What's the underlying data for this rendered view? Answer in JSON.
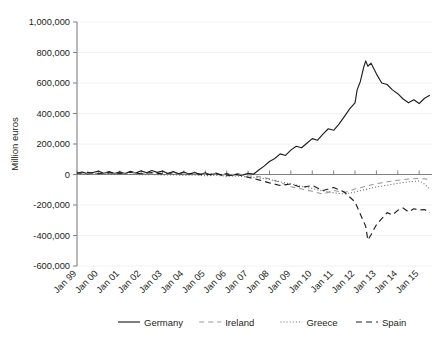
{
  "chart_data": {
    "type": "line",
    "title": "",
    "xlabel": "",
    "ylabel": "Million euros",
    "ylim": [
      -600000,
      1000000
    ],
    "ytick_labels": [
      "1,000,000",
      "800,000",
      "600,000",
      "400,000",
      "200,000",
      "0",
      "-200,000",
      "-400,000",
      "-600,000"
    ],
    "ytick_values": [
      1000000,
      800000,
      600000,
      400000,
      200000,
      0,
      -200000,
      -400000,
      -600000
    ],
    "xtick_labels": [
      "Jan 99",
      "Jan 00",
      "Jan 01",
      "Jan 02",
      "Jan 03",
      "Jan 04",
      "Jan 05",
      "Jan 06",
      "Jan 07",
      "Jan 08",
      "Jan 09",
      "Jan 10",
      "Jan 11",
      "Jan 12",
      "Jan 13",
      "Jan 14",
      "Jan 15"
    ],
    "xlim": [
      1999.0,
      2015.6
    ],
    "grid": "horizontal",
    "legend_position": "bottom",
    "series": [
      {
        "name": "Germany",
        "style": "solid",
        "color": "#231f20",
        "x": [
          1999.0,
          1999.25,
          1999.5,
          1999.75,
          2000.0,
          2000.25,
          2000.5,
          2000.75,
          2001.0,
          2001.25,
          2001.5,
          2001.75,
          2002.0,
          2002.25,
          2002.5,
          2002.75,
          2003.0,
          2003.25,
          2003.5,
          2003.75,
          2004.0,
          2004.25,
          2004.5,
          2004.75,
          2005.0,
          2005.25,
          2005.5,
          2005.75,
          2006.0,
          2006.25,
          2006.5,
          2006.75,
          2007.0,
          2007.25,
          2007.5,
          2007.75,
          2008.0,
          2008.25,
          2008.5,
          2008.75,
          2009.0,
          2009.25,
          2009.5,
          2009.75,
          2010.0,
          2010.25,
          2010.5,
          2010.75,
          2011.0,
          2011.25,
          2011.5,
          2011.75,
          2012.0,
          2012.1,
          2012.25,
          2012.4,
          2012.5,
          2012.6,
          2012.75,
          2013.0,
          2013.25,
          2013.5,
          2013.75,
          2014.0,
          2014.25,
          2014.5,
          2014.75,
          2015.0,
          2015.25,
          2015.5
        ],
        "y": [
          9000,
          16000,
          4000,
          13000,
          22000,
          8000,
          19000,
          6000,
          17000,
          5000,
          21000,
          9000,
          24000,
          11000,
          26000,
          14000,
          22000,
          7000,
          19000,
          4000,
          17000,
          2000,
          14000,
          -2000,
          12000,
          -3000,
          9000,
          -5000,
          6000,
          -6000,
          4000,
          -4000,
          8000,
          2000,
          30000,
          55000,
          85000,
          105000,
          135000,
          125000,
          160000,
          185000,
          175000,
          205000,
          235000,
          225000,
          265000,
          300000,
          290000,
          330000,
          380000,
          430000,
          470000,
          555000,
          610000,
          700000,
          745000,
          710000,
          730000,
          660000,
          600000,
          590000,
          555000,
          530000,
          495000,
          470000,
          490000,
          465000,
          500000,
          520000
        ]
      },
      {
        "name": "Ireland",
        "style": "dashed-light",
        "color": "#9a9a9a",
        "x": [
          1999.0,
          1999.5,
          2000.0,
          2000.5,
          2001.0,
          2001.5,
          2002.0,
          2002.5,
          2003.0,
          2003.5,
          2004.0,
          2004.5,
          2005.0,
          2005.5,
          2006.0,
          2006.5,
          2007.0,
          2007.5,
          2008.0,
          2008.5,
          2009.0,
          2009.5,
          2010.0,
          2010.5,
          2011.0,
          2011.5,
          2012.0,
          2012.5,
          2013.0,
          2013.5,
          2014.0,
          2014.5,
          2015.0,
          2015.5
        ],
        "y": [
          6000,
          10000,
          4000,
          12000,
          6000,
          14000,
          4000,
          11000,
          3000,
          9000,
          2000,
          8000,
          0,
          5000,
          -3000,
          2000,
          -8000,
          -14000,
          -28000,
          -52000,
          -80000,
          -95000,
          -110000,
          -128000,
          -105000,
          -118000,
          -95000,
          -78000,
          -60000,
          -48000,
          -38000,
          -30000,
          -26000,
          -32000
        ]
      },
      {
        "name": "Greece",
        "style": "dotted",
        "color": "#6b6b6b",
        "x": [
          1999.0,
          1999.5,
          2000.0,
          2000.5,
          2001.0,
          2001.5,
          2002.0,
          2002.5,
          2003.0,
          2003.5,
          2004.0,
          2004.5,
          2005.0,
          2005.5,
          2006.0,
          2006.5,
          2007.0,
          2007.5,
          2008.0,
          2008.5,
          2009.0,
          2009.5,
          2010.0,
          2010.5,
          2011.0,
          2011.5,
          2012.0,
          2012.5,
          2013.0,
          2013.5,
          2014.0,
          2014.5,
          2015.0,
          2015.25,
          2015.5
        ],
        "y": [
          2000,
          4000,
          1000,
          3000,
          0,
          2000,
          -2000,
          0,
          -4000,
          -2000,
          -6000,
          -4000,
          -8000,
          -6000,
          -12000,
          -10000,
          -16000,
          -22000,
          -32000,
          -48000,
          -62000,
          -78000,
          -92000,
          -108000,
          -120000,
          -128000,
          -115000,
          -98000,
          -82000,
          -70000,
          -58000,
          -48000,
          -42000,
          -62000,
          -96000
        ]
      },
      {
        "name": "Spain",
        "style": "dashed",
        "color": "#231f20",
        "x": [
          1999.0,
          1999.5,
          2000.0,
          2000.5,
          2001.0,
          2001.5,
          2002.0,
          2002.5,
          2003.0,
          2003.5,
          2004.0,
          2004.5,
          2005.0,
          2005.5,
          2006.0,
          2006.5,
          2007.0,
          2007.5,
          2008.0,
          2008.5,
          2009.0,
          2009.5,
          2010.0,
          2010.5,
          2011.0,
          2011.5,
          2012.0,
          2012.25,
          2012.5,
          2012.6,
          2012.75,
          2013.0,
          2013.25,
          2013.5,
          2013.75,
          2014.0,
          2014.25,
          2014.5,
          2014.75,
          2015.0,
          2015.25,
          2015.5
        ],
        "y": [
          8000,
          14000,
          5000,
          12000,
          7000,
          15000,
          5000,
          13000,
          4000,
          11000,
          2000,
          9000,
          -2000,
          5000,
          -8000,
          -2000,
          -18000,
          -35000,
          -55000,
          -72000,
          -62000,
          -85000,
          -72000,
          -105000,
          -85000,
          -115000,
          -180000,
          -260000,
          -340000,
          -430000,
          -395000,
          -330000,
          -290000,
          -250000,
          -265000,
          -235000,
          -220000,
          -245000,
          -225000,
          -232000,
          -230000,
          -250000
        ]
      }
    ]
  },
  "legend": {
    "items": [
      {
        "label": "Germany"
      },
      {
        "label": "Ireland"
      },
      {
        "label": "Greece"
      },
      {
        "label": "Spain"
      }
    ]
  }
}
